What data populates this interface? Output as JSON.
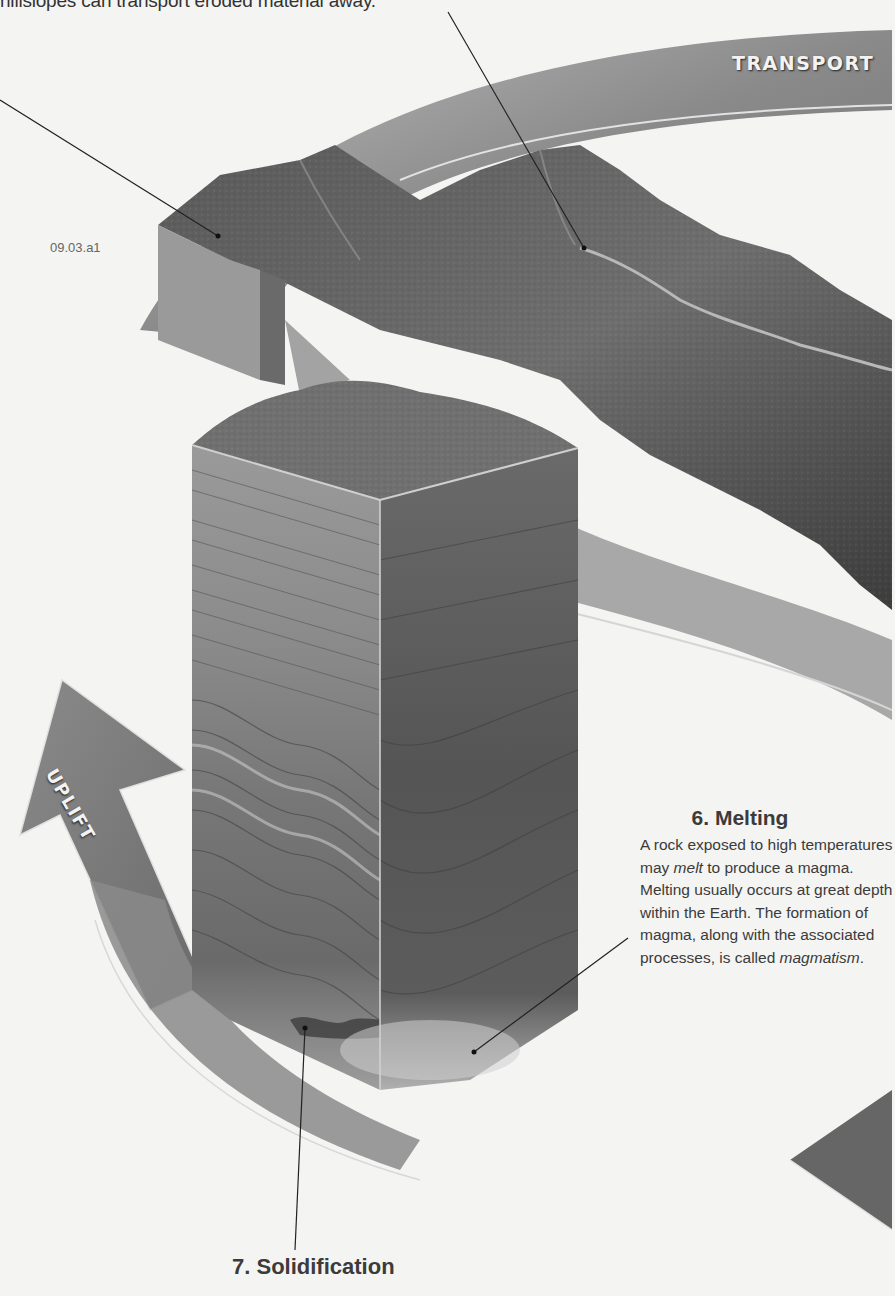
{
  "figure": {
    "id": "09.03.a1",
    "top_caption": "hillslopes can transport eroded material away.",
    "colors": {
      "page_bg": "#f4f4f3",
      "band": "#7a7a7a",
      "band_edge": "#d9d9d9",
      "terrain_dark": "#4a4a4a",
      "terrain_light": "#8c8c8c",
      "text": "#3b3b3b"
    }
  },
  "bands": {
    "transport": "TRANSPORT",
    "uplift": "UPLIFT"
  },
  "steps": {
    "melting": {
      "number": "6.",
      "title": "6. Melting",
      "body_part1": "A rock exposed to high temperatures may ",
      "body_em1": "melt",
      "body_part2": " to produce a magma. Melting usually occurs at great depth within the Earth. The formation of magma, along with the associated processes, is called ",
      "body_em2": "magmatism",
      "body_part3": "."
    },
    "solidification": {
      "title": "7. Solidification"
    }
  }
}
